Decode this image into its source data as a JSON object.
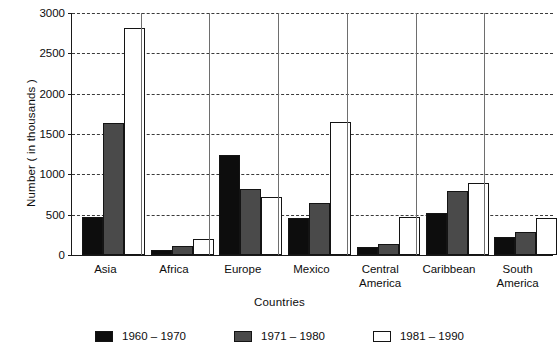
{
  "chart_data": {
    "type": "bar",
    "title": "",
    "xlabel": "Countries",
    "ylabel": "Number ( in thousands )",
    "ylim": [
      0,
      3000
    ],
    "yticks": [
      0,
      500,
      1000,
      1500,
      2000,
      2500,
      3000
    ],
    "ytick_labels": [
      "0",
      "500",
      "1000",
      "1500",
      "2000",
      "2500",
      "3000"
    ],
    "grid": true,
    "legend_position": "bottom",
    "categories": [
      "Asia",
      "Africa",
      "Europe",
      "Mexico",
      "Central\nAmerica",
      "Caribbean",
      "South\nAmerica"
    ],
    "series": [
      {
        "name": "1960 – 1970",
        "color": "#0d0d0d",
        "values": [
          470,
          60,
          1240,
          455,
          105,
          520,
          225
        ]
      },
      {
        "name": "1971 – 1980",
        "color": "#4a4a4a",
        "values": [
          1640,
          115,
          820,
          645,
          140,
          790,
          290
        ]
      },
      {
        "name": "1981 – 1990",
        "color": "#ffffff",
        "values": [
          2820,
          200,
          720,
          1650,
          470,
          890,
          460
        ]
      }
    ]
  }
}
